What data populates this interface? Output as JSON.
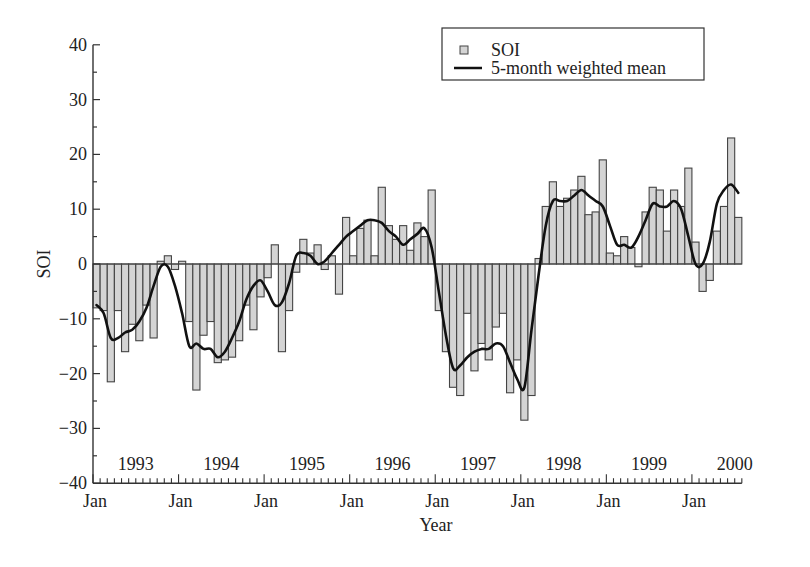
{
  "chart_data": {
    "type": "bar",
    "title": "",
    "xlabel": "Year",
    "ylabel": "SOI",
    "ylim": [
      -40,
      40
    ],
    "yticks": [
      -40,
      -30,
      -20,
      -10,
      0,
      10,
      20,
      30,
      40
    ],
    "grid": false,
    "legend_position": "upper right",
    "x_start": "Jan 1993",
    "x_end": "Jul 2000",
    "x_major_tick_labels": [
      "Jan",
      "Jan",
      "Jan",
      "Jan",
      "Jan",
      "Jan",
      "Jan",
      "Jan"
    ],
    "year_labels": [
      "1993",
      "1994",
      "1995",
      "1996",
      "1997",
      "1998",
      "1999",
      "2000"
    ],
    "series": [
      {
        "name": "SOI",
        "type": "bar",
        "color": "#d4d4d4",
        "values": [
          -8,
          -8.5,
          -21.5,
          -8.5,
          -16,
          -11,
          -14,
          -7.5,
          -13.5,
          0.5,
          1.5,
          -1,
          0.5,
          -10.5,
          -23,
          -13,
          -10.5,
          -18,
          -17.5,
          -17,
          -14,
          -7.5,
          -12,
          -6,
          -2.5,
          3.5,
          -16,
          -8.5,
          -1.5,
          4.5,
          2,
          3.5,
          -1,
          1.5,
          -5.5,
          8.5,
          1.5,
          6.5,
          8,
          1.5,
          14,
          7,
          4.5,
          7,
          2.5,
          7.5,
          5,
          13.5,
          -8.5,
          -16,
          -22.5,
          -24,
          -9,
          -19.5,
          -14.5,
          -17.5,
          -11.5,
          -9,
          -23.5,
          -17.5,
          -28.5,
          -24,
          1,
          10.5,
          15,
          10.5,
          12,
          13.5,
          16,
          9,
          9.5,
          19,
          2,
          1.5,
          5,
          3,
          -0.5,
          9.5,
          14,
          13.5,
          6,
          13.5,
          10.5,
          17.5,
          4,
          -5,
          -3,
          6,
          10.5,
          23,
          8.5
        ]
      },
      {
        "name": "5-month weighted mean",
        "type": "line",
        "color": "#111111",
        "values": [
          -7.5,
          -9,
          -13.5,
          -13.5,
          -12.5,
          -12,
          -10.5,
          -8,
          -4,
          -0.5,
          -0.5,
          -4,
          -9,
          -15,
          -14.5,
          -15.5,
          -15.5,
          -17,
          -16,
          -13.5,
          -10.5,
          -6.5,
          -4,
          -3,
          -5,
          -7.5,
          -7,
          -3.5,
          1.5,
          2,
          1.5,
          0,
          0.5,
          2,
          3.5,
          5,
          6,
          7,
          8,
          8,
          7.5,
          6,
          5,
          3.5,
          4.5,
          5.5,
          6.5,
          3,
          -5,
          -13,
          -19,
          -18.5,
          -17,
          -16,
          -15.5,
          -15.5,
          -14.5,
          -15,
          -18,
          -21,
          -22.5,
          -12,
          -2,
          7,
          11.5,
          11.5,
          11.5,
          12.5,
          13.5,
          12.5,
          11.5,
          10.5,
          7,
          3.5,
          3.5,
          3,
          5,
          8,
          11,
          10.5,
          10.5,
          11.5,
          10,
          5,
          0,
          0,
          4,
          11,
          13.5,
          14.5,
          13
        ]
      }
    ]
  },
  "legend": {
    "items": [
      {
        "label": "SOI",
        "symbol": "square"
      },
      {
        "label": "5-month weighted mean",
        "symbol": "line"
      }
    ]
  },
  "axes": {
    "ylabel": "SOI",
    "xlabel": "Year",
    "ytick_labels": [
      "40",
      "30",
      "20",
      "10",
      "0",
      "−10",
      "−20",
      "−30",
      "−40"
    ]
  }
}
